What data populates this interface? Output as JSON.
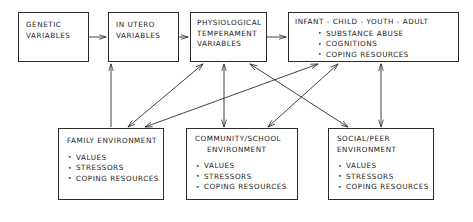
{
  "diagram": {
    "type": "developmental-ecological-model",
    "style": {
      "background": "#ffffff",
      "line_color": "#2b2b2b",
      "text_color": "#1a1a1a"
    },
    "nodes": {
      "genetic": {
        "id": "genetic-variables",
        "title_line1": "GENETIC",
        "title_line2": "VARIABLES"
      },
      "in_utero": {
        "id": "in-utero-variables",
        "title_line1": "IN UTERO",
        "title_line2": "VARIABLES"
      },
      "physiological": {
        "id": "physiological-temperament-variables",
        "title_line1": "PHYSIOLOGICAL",
        "title_line2": "TEMPERAMENT",
        "title_line3": "VARIABLES"
      },
      "infant": {
        "id": "infant-child-youth-adult",
        "title": "INFANT - CHILD - YOUTH - ADULT",
        "items": [
          "SUBSTANCE ABUSE",
          "COGNITIONS",
          "COPING RESOURCES"
        ]
      },
      "family": {
        "id": "family-environment",
        "title_line1": "FAMILY ENVIRONMENT",
        "title_line2": "",
        "items": [
          "VALUES",
          "STRESSORS",
          "COPING RESOURCES"
        ]
      },
      "community": {
        "id": "community-school-environment",
        "title_line1": "COMMUNITY/SCHOOL",
        "title_line2": "ENVIRONMENT",
        "items": [
          "VALUES",
          "STRESSORS",
          "COPING RESOURCES"
        ]
      },
      "social_peer": {
        "id": "social-peer-environment",
        "title_line1": "SOCIAL/PEER",
        "title_line2": "ENVIRONMENT",
        "items": [
          "VALUES",
          "STRESSORS",
          "COPING RESOURCES"
        ]
      }
    },
    "connections": [
      {
        "from": "genetic",
        "to": "in_utero",
        "heads": "single"
      },
      {
        "from": "in_utero",
        "to": "physiological",
        "heads": "single"
      },
      {
        "from": "physiological",
        "to": "infant",
        "heads": "single"
      },
      {
        "from": "family",
        "to": "in_utero",
        "heads": "single"
      },
      {
        "from": "physiological",
        "to": "community",
        "heads": "double"
      },
      {
        "from": "infant",
        "to": "social_peer",
        "heads": "double"
      },
      {
        "from": "physiological",
        "to": "family",
        "heads": "double"
      },
      {
        "from": "infant",
        "to": "family",
        "heads": "double"
      },
      {
        "from": "physiological",
        "to": "social_peer",
        "heads": "double"
      },
      {
        "from": "infant",
        "to": "community",
        "heads": "double"
      }
    ]
  }
}
